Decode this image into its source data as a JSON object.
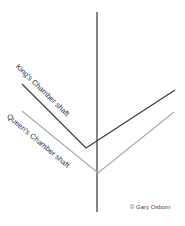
{
  "diagram": {
    "labels": {
      "kings_shaft": "King's Chamber shaft",
      "queens_shaft": "Queen's Chamber shaft"
    },
    "copyright": "© Gary Osborn",
    "colors": {
      "vertical_axis": "#333333",
      "kings_shaft": "#3a3a3a",
      "queens_shaft": "#aaaaaa"
    }
  }
}
